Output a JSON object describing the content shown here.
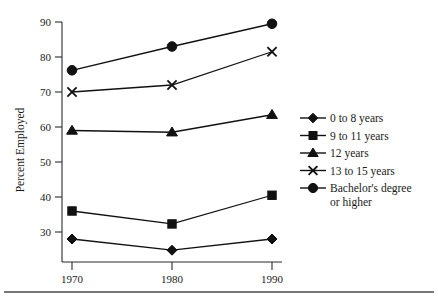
{
  "chart_data": {
    "type": "line",
    "title": "",
    "subtitle": "",
    "xlabel": "",
    "ylabel": "Percent Employed",
    "x": [
      1970,
      1980,
      1990
    ],
    "categories": [
      "1970",
      "1980",
      "1990"
    ],
    "xtick_labels": [
      "1970",
      "1980",
      "1990"
    ],
    "ytick_labels": [
      "30",
      "40",
      "50",
      "60",
      "70",
      "80",
      "90"
    ],
    "ytick_values": [
      30,
      40,
      50,
      60,
      70,
      80,
      90
    ],
    "ylim": [
      25,
      90
    ],
    "xlim": [
      1970,
      1990
    ],
    "grid": false,
    "legend_position": "right",
    "series": [
      {
        "name": "0 to 8 years",
        "marker": "diamond",
        "values": [
          28.0,
          24.8,
          28.0
        ]
      },
      {
        "name": "9 to 11 years",
        "marker": "square",
        "values": [
          36.0,
          32.3,
          40.5
        ]
      },
      {
        "name": "12 years",
        "marker": "triangle",
        "values": [
          59.0,
          58.5,
          63.5
        ]
      },
      {
        "name": "13 to 15 years",
        "marker": "x",
        "values": [
          70.0,
          72.0,
          81.5
        ]
      },
      {
        "name": "Bachelor's degree or higher",
        "marker": "circle",
        "values": [
          76.2,
          83.0,
          89.5
        ]
      }
    ],
    "colors": {
      "line": "#111111",
      "axis": "#2b2b2b",
      "text": "#1a1a1a",
      "background": "#ffffff",
      "rule": "#4a4a4a"
    }
  },
  "legend": {
    "entries": [
      {
        "label": "0 to 8 years",
        "marker": "diamond-marker-icon"
      },
      {
        "label": "9 to 11 years",
        "marker": "square-marker-icon"
      },
      {
        "label": "12 years",
        "marker": "triangle-marker-icon"
      },
      {
        "label": "13 to 15 years",
        "marker": "x-marker-icon"
      },
      {
        "label": "Bachelor's degree",
        "label2": "or higher",
        "marker": "circle-marker-icon"
      }
    ]
  },
  "axes": {
    "y_axis_title": "Percent Employed",
    "y_ticks": [
      "90",
      "80",
      "70",
      "60",
      "50",
      "40",
      "30"
    ],
    "x_ticks": [
      "1970",
      "1980",
      "1990"
    ]
  }
}
